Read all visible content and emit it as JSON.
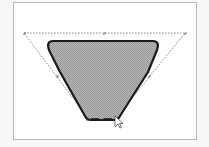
{
  "canvas": {
    "background": "#ffffff",
    "border_color": "#b9b9b9"
  },
  "shape": {
    "type": "trapezoid",
    "fill": "#a8a8a8",
    "stroke": "#1a1a1a",
    "selected": true
  },
  "selection": {
    "outline_style": "dashed",
    "outline_color": "#6a6a6a",
    "handles": [
      "top-left",
      "top-center",
      "top-right",
      "left-middle",
      "right-middle",
      "bottom-left",
      "bottom-center",
      "bottom-right"
    ]
  },
  "cursor": {
    "type": "arrow-pointer"
  }
}
